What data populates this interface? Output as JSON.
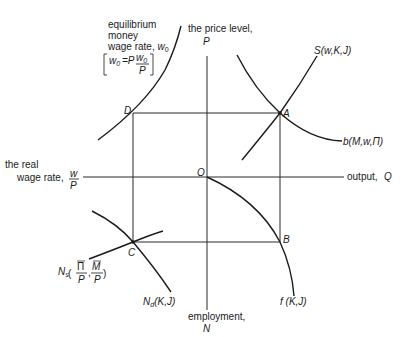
{
  "diagram": {
    "type": "four-quadrant macroeconomic diagram",
    "axes": {
      "top": {
        "line1": "the price level,",
        "symbol": "P"
      },
      "right": {
        "text": "output,",
        "symbol": "Q"
      },
      "bottom": {
        "line1": "employment,",
        "symbol": "N"
      },
      "left": {
        "line1": "the real",
        "line2": "wage rate,",
        "symbol_num": "w",
        "symbol_den": "P"
      }
    },
    "origin_label": "O",
    "points": {
      "A": "A",
      "B": "B",
      "C": "C",
      "D": "D"
    },
    "curves": {
      "wage_curve": {
        "line1": "equilibrium",
        "line2": "money",
        "line3": "wage rate,",
        "symbol": "w",
        "subscript": "0",
        "bracket_lhs": "w",
        "bracket_lhs_sub": "0",
        "bracket_eq": "=P",
        "bracket_num": "w",
        "bracket_num_sub": "0",
        "bracket_den": "P"
      },
      "supply": {
        "label": "S(w,K,J)"
      },
      "demand": {
        "label": "b(M,w,Π)"
      },
      "production": {
        "label": "f (K,J)"
      },
      "labor_demand": {
        "label": "N",
        "sub": "d",
        "args": "(K,J)"
      },
      "labor_supply": {
        "label": "N",
        "sub": "s",
        "arg1_num": "Π",
        "arg1_den": "P",
        "arg2_num": "M",
        "arg2_den": "P"
      }
    }
  }
}
